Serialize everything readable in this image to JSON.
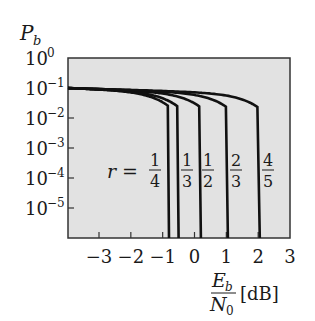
{
  "chart_data": {
    "type": "line",
    "title": "",
    "ylabel": "P_b",
    "xlabel": "E_b/N_0 [dB]",
    "xlabel_parts": {
      "num": "E",
      "num_sub": "b",
      "den": "N",
      "den_sub": "0",
      "unit": "[dB]"
    },
    "ylabel_parts": {
      "main": "P",
      "sub": "b"
    },
    "xlim": [
      -4,
      3
    ],
    "ylim_log10": [
      -6,
      0
    ],
    "yscale": "log",
    "grid": false,
    "x_ticks": [
      -3,
      -2,
      -1,
      0,
      1,
      2,
      3
    ],
    "x_tick_labels": [
      "−3",
      "−2",
      "−1",
      "0",
      "1",
      "2",
      "3"
    ],
    "y_ticks_log10": [
      0,
      -1,
      -2,
      -3,
      -4,
      -5
    ],
    "y_tick_labels": [
      {
        "base": "10",
        "exp": "0"
      },
      {
        "base": "10",
        "exp": "−1"
      },
      {
        "base": "10",
        "exp": "−2"
      },
      {
        "base": "10",
        "exp": "−3"
      },
      {
        "base": "10",
        "exp": "−4"
      },
      {
        "base": "10",
        "exp": "−5"
      }
    ],
    "annotation_prefix": "r =",
    "series": [
      {
        "name": "r = 1/4",
        "num": "1",
        "den": "4",
        "threshold_db": -0.8
      },
      {
        "name": "r = 1/3",
        "num": "1",
        "den": "3",
        "threshold_db": -0.5
      },
      {
        "name": "r = 1/2",
        "num": "1",
        "den": "2",
        "threshold_db": 0.2
      },
      {
        "name": "r = 2/3",
        "num": "2",
        "den": "3",
        "threshold_db": 1.05
      },
      {
        "name": "r = 4/5",
        "num": "4",
        "den": "5",
        "threshold_db": 2.05
      }
    ],
    "curve_start": {
      "x": -4,
      "log10_y": -1.0
    },
    "background_color": "#e0e0e0",
    "line_color": "#111111"
  }
}
